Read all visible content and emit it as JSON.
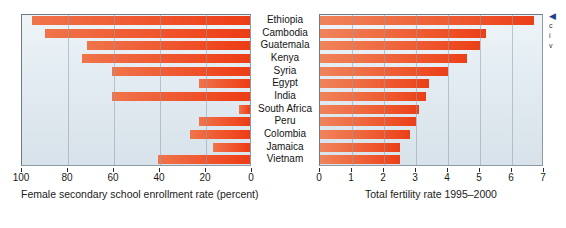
{
  "chart_data": [
    {
      "type": "bar",
      "orientation": "horizontal",
      "direction": "right-to-left",
      "title": "",
      "xlabel": "Female secondary school enrollment rate (percent)",
      "ylabel": "",
      "xlim": [
        100,
        0
      ],
      "xticks": [
        100,
        80,
        60,
        40,
        20,
        0
      ],
      "xtick_labels": [
        "100",
        "80",
        "60",
        "40",
        "20",
        "0"
      ],
      "grid": true,
      "legend": "none",
      "categories": [
        "Ethiopia",
        "Cambodia",
        "Guatemala",
        "Kenya",
        "Syria",
        "Egypt",
        "India",
        "South Africa",
        "Peru",
        "Colombia",
        "Jamaica",
        "Vietnam"
      ],
      "values": [
        5,
        11,
        29,
        27,
        40,
        78,
        40,
        95,
        78,
        74,
        84,
        60
      ]
    },
    {
      "type": "bar",
      "orientation": "horizontal",
      "direction": "left-to-right",
      "title": "",
      "xlabel": "Total fertility rate 1995–2000",
      "ylabel": "",
      "xlim": [
        0,
        7
      ],
      "xticks": [
        0,
        1,
        2,
        3,
        4,
        5,
        6,
        7
      ],
      "xtick_labels": [
        "0",
        "1",
        "2",
        "3",
        "4",
        "5",
        "6",
        "7"
      ],
      "grid": true,
      "legend": "none",
      "categories": [
        "Ethiopia",
        "Cambodia",
        "Guatemala",
        "Kenya",
        "Syria",
        "Egypt",
        "India",
        "South Africa",
        "Peru",
        "Colombia",
        "Jamaica",
        "Vietnam"
      ],
      "values": [
        6.7,
        5.2,
        5.0,
        4.6,
        4.0,
        3.4,
        3.3,
        3.1,
        3.0,
        2.8,
        2.5,
        2.5
      ]
    }
  ],
  "left_chart": {
    "axis_title": "Female secondary school enrollment rate (percent)",
    "tick_labels": [
      "100",
      "80",
      "60",
      "40",
      "20",
      "0"
    ]
  },
  "right_chart": {
    "axis_title": "Total fertility rate 1995–2000",
    "tick_labels": [
      "0",
      "1",
      "2",
      "3",
      "4",
      "5",
      "6",
      "7"
    ]
  },
  "categories": [
    "Ethiopia",
    "Cambodia",
    "Guatemala",
    "Kenya",
    "Syria",
    "Egypt",
    "India",
    "South Africa",
    "Peru",
    "Colombia",
    "Jamaica",
    "Vietnam"
  ],
  "annotation": {
    "arrow": "◀",
    "lines": [
      "c",
      "i",
      "v"
    ]
  },
  "colors": {
    "bar_light": "#f0835b",
    "bar_dark": "#eb3f18",
    "plot_background_top": "#eef5f8",
    "plot_background_bottom": "#d8e2ea",
    "gridline": "#8ca0af",
    "text": "#1a1a1a",
    "annotation_arrow": "#1d3f8a"
  }
}
